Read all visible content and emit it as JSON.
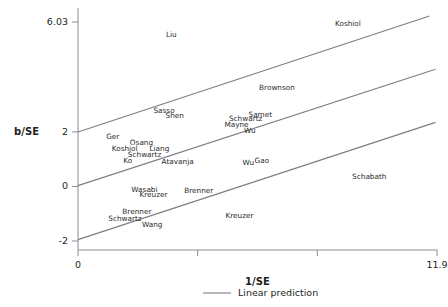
{
  "chart_data": {
    "type": "scatter",
    "title": "",
    "subtitle": "",
    "xlabel": "1/SE",
    "ylabel": "b/SE",
    "xlim": [
      0,
      11.9
    ],
    "ylim": [
      -2,
      6.03
    ],
    "grid": false,
    "legend_position": "bottom-center",
    "legend": [
      {
        "label": "Linear prediction",
        "marker": "line",
        "color": "#7d7d86"
      }
    ],
    "xticks": [
      {
        "value": 0,
        "label": "0"
      },
      {
        "value": 3.966,
        "label": ""
      },
      {
        "value": 7.933,
        "label": ""
      },
      {
        "value": 11.9,
        "label": "11.9"
      }
    ],
    "yticks": [
      {
        "value": 6.03,
        "label": "6.03"
      },
      {
        "value": 2,
        "label": "2"
      },
      {
        "value": 0,
        "label": "0"
      },
      {
        "value": -2,
        "label": "-2"
      }
    ],
    "annotations": [
      {
        "text": "Liu",
        "x": 3.1,
        "y": 5.55
      },
      {
        "text": "Koshiol",
        "x": 8.95,
        "y": 5.95
      },
      {
        "text": "Brownson",
        "x": 6.6,
        "y": 3.6
      },
      {
        "text": "Sasso",
        "x": 2.85,
        "y": 2.77
      },
      {
        "text": "Shen",
        "x": 3.2,
        "y": 2.58
      },
      {
        "text": "Samet",
        "x": 6.05,
        "y": 2.63
      },
      {
        "text": "Schwartz",
        "x": 5.55,
        "y": 2.48
      },
      {
        "text": "Mayne",
        "x": 5.25,
        "y": 2.25
      },
      {
        "text": "Wu",
        "x": 5.7,
        "y": 2.02
      },
      {
        "text": "Ger",
        "x": 1.15,
        "y": 1.81
      },
      {
        "text": "Osang",
        "x": 2.1,
        "y": 1.58
      },
      {
        "text": "Koshiol",
        "x": 1.55,
        "y": 1.38
      },
      {
        "text": "Liang",
        "x": 2.7,
        "y": 1.38
      },
      {
        "text": "Schwartz",
        "x": 2.2,
        "y": 1.16
      },
      {
        "text": "Ko",
        "x": 1.65,
        "y": 0.93
      },
      {
        "text": "Atavanja",
        "x": 3.3,
        "y": 0.88
      },
      {
        "text": "Wu",
        "x": 5.65,
        "y": 0.87
      },
      {
        "text": "Gao",
        "x": 6.1,
        "y": 0.94
      },
      {
        "text": "Schabath",
        "x": 9.65,
        "y": 0.36
      },
      {
        "text": "Wasabi",
        "x": 2.2,
        "y": -0.12
      },
      {
        "text": "Kreuzer",
        "x": 2.5,
        "y": -0.33
      },
      {
        "text": "Brenner",
        "x": 4.0,
        "y": -0.17
      },
      {
        "text": "Brenner",
        "x": 1.95,
        "y": -0.95
      },
      {
        "text": "Schwartz",
        "x": 1.55,
        "y": -1.2
      },
      {
        "text": "Wang",
        "x": 2.45,
        "y": -1.42
      },
      {
        "text": "Kreuzer",
        "x": 5.35,
        "y": -1.08
      }
    ],
    "lines": [
      {
        "name": "upper-prediction-line",
        "x0": 0,
        "y0": 2.0,
        "x1": 11.65,
        "y1": 6.25
      },
      {
        "name": "middle-prediction-line",
        "x0": 0,
        "y0": 0.03,
        "x1": 11.85,
        "y1": 4.3
      },
      {
        "name": "lower-prediction-line",
        "x0": 0,
        "y0": -1.95,
        "x1": 11.85,
        "y1": 2.35
      }
    ]
  }
}
